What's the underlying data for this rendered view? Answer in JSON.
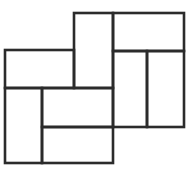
{
  "figure": {
    "caption": "",
    "width": 193,
    "height": 178,
    "background_color": "#ffffff",
    "line_color": "#2b2b2b",
    "line_width": 2.6,
    "tile_fill": "#ffffff",
    "tile_count": 8,
    "grid": {
      "x_lines": [
        5,
        42,
        74,
        113,
        147,
        184
      ],
      "y_lines": [
        13,
        50,
        88,
        127,
        163
      ]
    },
    "tiles": [
      {
        "name": "top-center-vertical-tile",
        "orientation": "vertical",
        "x": 74,
        "y": 13,
        "width": 39,
        "height": 75,
        "label": ""
      },
      {
        "name": "top-right-horizontal-tile",
        "orientation": "horizontal",
        "x": 113,
        "y": 13,
        "width": 71,
        "height": 38,
        "label": ""
      },
      {
        "name": "upper-left-horizontal-tile",
        "orientation": "horizontal",
        "x": 5,
        "y": 50,
        "width": 69,
        "height": 38,
        "label": ""
      },
      {
        "name": "right-inner-vertical-tile",
        "orientation": "vertical",
        "x": 113,
        "y": 51,
        "width": 34,
        "height": 76,
        "label": ""
      },
      {
        "name": "right-outer-vertical-tile",
        "orientation": "vertical",
        "x": 147,
        "y": 51,
        "width": 37,
        "height": 76,
        "label": ""
      },
      {
        "name": "bottom-left-vertical-tile",
        "orientation": "vertical",
        "x": 5,
        "y": 88,
        "width": 37,
        "height": 75,
        "label": ""
      },
      {
        "name": "center-horizontal-tile",
        "orientation": "horizontal",
        "x": 42,
        "y": 88,
        "width": 71,
        "height": 39,
        "label": ""
      },
      {
        "name": "bottom-center-horizontal-tile",
        "orientation": "horizontal",
        "x": 42,
        "y": 127,
        "width": 71,
        "height": 36,
        "label": ""
      }
    ]
  }
}
